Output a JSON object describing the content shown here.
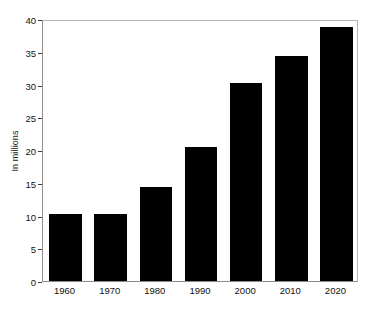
{
  "chart_data": {
    "type": "bar",
    "title": "",
    "xlabel": "",
    "ylabel": "In millions",
    "categories": [
      "1960",
      "1970",
      "1980",
      "1990",
      "2000",
      "2010",
      "2020"
    ],
    "values": [
      10.2,
      10.3,
      14.3,
      20.4,
      30.3,
      34.4,
      38.8
    ],
    "ylim": [
      0,
      40
    ],
    "yticks": [
      "0",
      "5",
      "10",
      "15",
      "20",
      "25",
      "30",
      "35",
      "40"
    ],
    "ytick_values": [
      0,
      5,
      10,
      15,
      20,
      25,
      30,
      35,
      40
    ],
    "grid": false,
    "legend": false,
    "bar_color": "#000000",
    "frame_color": "#8c8c8c",
    "background": "#ffffff"
  }
}
